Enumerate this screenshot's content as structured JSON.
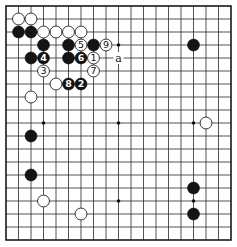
{
  "diagram": {
    "type": "go-board",
    "size": 19,
    "geometry": {
      "left": 6,
      "top": 6,
      "right": 231,
      "bottom": 240
    },
    "colors": {
      "line": "#2a2a2a",
      "black_stone": "#141414",
      "white_stone": "#ffffff",
      "background": "#ffffff"
    },
    "star_points": [
      {
        "col": 4,
        "row": 4
      },
      {
        "col": 10,
        "row": 4
      },
      {
        "col": 16,
        "row": 4
      },
      {
        "col": 4,
        "row": 10
      },
      {
        "col": 10,
        "row": 10
      },
      {
        "col": 16,
        "row": 10
      },
      {
        "col": 4,
        "row": 16
      },
      {
        "col": 10,
        "row": 16
      },
      {
        "col": 16,
        "row": 16
      }
    ],
    "stones": [
      {
        "color": "white",
        "col": 2,
        "row": 2
      },
      {
        "color": "white",
        "col": 3,
        "row": 2
      },
      {
        "color": "black",
        "col": 2,
        "row": 3
      },
      {
        "color": "black",
        "col": 3,
        "row": 3
      },
      {
        "color": "white",
        "col": 4,
        "row": 3
      },
      {
        "color": "white",
        "col": 5,
        "row": 3
      },
      {
        "color": "white",
        "col": 6,
        "row": 3
      },
      {
        "color": "white",
        "col": 7,
        "row": 3
      },
      {
        "color": "black",
        "col": 4,
        "row": 4
      },
      {
        "color": "black",
        "col": 6,
        "row": 4
      },
      {
        "color": "white",
        "col": 7,
        "row": 4,
        "number": "5"
      },
      {
        "color": "black",
        "col": 8,
        "row": 4
      },
      {
        "color": "white",
        "col": 9,
        "row": 4,
        "number": "9"
      },
      {
        "color": "black",
        "col": 16,
        "row": 4
      },
      {
        "color": "black",
        "col": 3,
        "row": 5
      },
      {
        "color": "black",
        "col": 4,
        "row": 5,
        "number": "4"
      },
      {
        "color": "black",
        "col": 6,
        "row": 5
      },
      {
        "color": "black",
        "col": 7,
        "row": 5,
        "number": "6"
      },
      {
        "color": "white",
        "col": 8,
        "row": 5,
        "number": "1"
      },
      {
        "color": "white",
        "col": 4,
        "row": 6,
        "number": "3"
      },
      {
        "color": "white",
        "col": 8,
        "row": 6,
        "number": "7"
      },
      {
        "color": "white",
        "col": 5,
        "row": 7
      },
      {
        "color": "black",
        "col": 6,
        "row": 7,
        "number": "8"
      },
      {
        "color": "black",
        "col": 7,
        "row": 7,
        "number": "2"
      },
      {
        "color": "white",
        "col": 3,
        "row": 8
      },
      {
        "color": "white",
        "col": 17,
        "row": 10
      },
      {
        "color": "black",
        "col": 3,
        "row": 11
      },
      {
        "color": "black",
        "col": 3,
        "row": 14
      },
      {
        "color": "black",
        "col": 16,
        "row": 15
      },
      {
        "color": "white",
        "col": 4,
        "row": 16
      },
      {
        "color": "white",
        "col": 7,
        "row": 17
      },
      {
        "color": "black",
        "col": 16,
        "row": 17
      }
    ],
    "labels": [
      {
        "text": "a",
        "col": 10,
        "row": 5
      }
    ]
  }
}
